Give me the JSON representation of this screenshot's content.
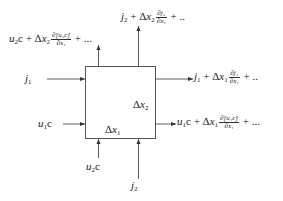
{
  "diagram": {
    "type": "control-volume-flux-balance",
    "box": {
      "width_label": "Δx₁",
      "height_label": "Δx₂"
    },
    "inputs": {
      "left_top": {
        "var": "j",
        "sub": "1"
      },
      "left_bottom": {
        "var": "u",
        "sub": "1",
        "tail": "c"
      },
      "bottom_left": {
        "var": "u",
        "sub": "2",
        "tail": "c"
      },
      "bottom_right": {
        "var": "j",
        "sub": "2"
      }
    },
    "outputs": {
      "right_top": {
        "lead": "j",
        "lead_sub": "1",
        "plus": "+ Δ",
        "dx": "x",
        "dx_sub": "1",
        "num": "∂j₁",
        "den": "∂x₁",
        "tail": "+ .."
      },
      "right_bottom": {
        "lead": "u",
        "lead_sub": "1",
        "lead_tail": "c",
        "plus": "+ Δ",
        "dx": "x",
        "dx_sub": "1",
        "num": "∂[u₁c]",
        "den": "∂x₁",
        "tail": "+ ..."
      },
      "top_left": {
        "lead": "u",
        "lead_sub": "2",
        "lead_tail": "c",
        "plus": "+ Δ",
        "dx": "x",
        "dx_sub": "2",
        "num": "∂[u₂c]",
        "den": "∂x₁",
        "tail": "+ ..."
      },
      "top_right": {
        "lead": "j",
        "lead_sub": "2",
        "plus": "+ Δ",
        "dx": "x",
        "dx_sub": "2",
        "num": "∂j₂",
        "den": "∂x₁",
        "tail": "+ .."
      }
    },
    "labels": {
      "dx1_delta": "Δ",
      "dx1_x": "x",
      "dx1_sub": "1",
      "dx2_delta": "Δ",
      "dx2_x": "x",
      "dx2_sub": "2"
    },
    "colors": {
      "stroke": "#333333",
      "background": "#ffffff"
    }
  }
}
